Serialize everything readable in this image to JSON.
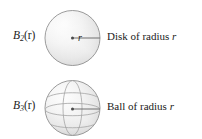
{
  "figure": {
    "background_color": "#ffffff",
    "width": 202,
    "height": 139,
    "shape_fill_light": "#f4f4f4",
    "shape_fill_mid": "#e2e2e2",
    "shape_fill_dark": "#c9c9c9",
    "outline_color": "#8d8d8d",
    "line_color": "#555555",
    "text_color": "#1b1b1b"
  },
  "rows": [
    {
      "id": "disk",
      "notation": {
        "base": "B",
        "subscript": "2",
        "argument": "(r)",
        "full": "B2(r)"
      },
      "shape": {
        "name": "disk",
        "radius_label": "r",
        "center_marker": "center-dot",
        "radius_line": "horizontal-right"
      },
      "caption": {
        "text": "Disk of radius ",
        "variable": "r",
        "full": "Disk of radius r"
      }
    },
    {
      "id": "ball",
      "notation": {
        "base": "B",
        "subscript": "3",
        "argument": "(r)",
        "full": "B3(r)"
      },
      "shape": {
        "name": "ball",
        "radius_label": "r",
        "center_marker": "center-dot",
        "radius_line": "horizontal-right"
      },
      "caption": {
        "text": "Ball of radius ",
        "variable": "r",
        "full": "Ball of radius r"
      }
    }
  ]
}
